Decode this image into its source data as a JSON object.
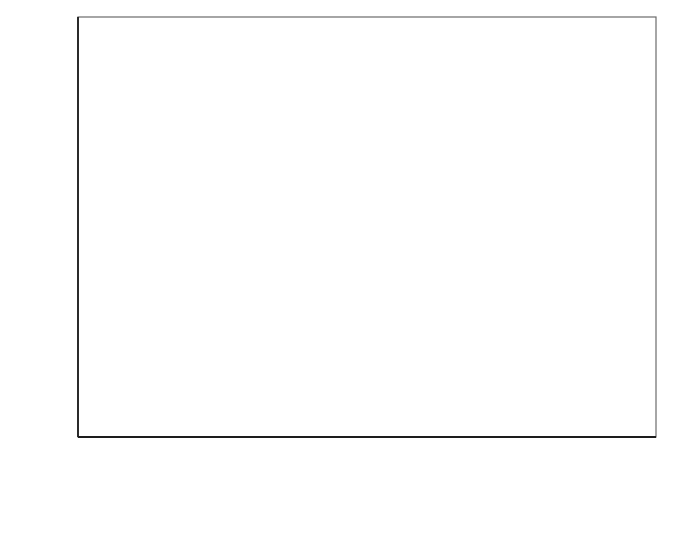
{
  "figure": {
    "background": "#ffffff",
    "frame_color": "#5a5a5a",
    "axis_color": "#1d1d1d"
  },
  "axes": {
    "y_label": "activity",
    "x_label_main": "x",
    "x_label_sub": "MgCl",
    "x_label_sub2": "2",
    "x_ticklabels": [
      "0,0",
      "0,2",
      "0,4",
      "0,6",
      "0,8",
      "1,0"
    ],
    "y_ticklabels": [
      "0,0",
      "0,2",
      "0,4",
      "0,6",
      "0,8",
      "1,0"
    ]
  },
  "chart_data": {
    "type": "scatter",
    "title": "",
    "xlabel": "x_MgCl2",
    "ylabel": "activity",
    "xlim": [
      0.0,
      1.0
    ],
    "ylim": [
      0.0,
      1.0
    ],
    "xticks": [
      0.0,
      0.2,
      0.4,
      0.6,
      0.8,
      1.0
    ],
    "yticks": [
      0.0,
      0.2,
      0.4,
      0.6,
      0.8,
      1.0
    ],
    "minor_tick_step": 0.1,
    "grid": false,
    "legend": "none",
    "decimal_separator": ",",
    "series": [
      {
        "name": "water activity",
        "marker": "open-triangle",
        "marker_color": "#ffffff",
        "marker_edge": "#606060",
        "line_style": "solid",
        "line_color": "#404040",
        "points": [
          {
            "x": 0.1,
            "y": 0.865
          },
          {
            "x": 0.15,
            "y": 0.77
          },
          {
            "x": 0.2,
            "y": 0.65
          },
          {
            "x": 0.25,
            "y": 0.525
          },
          {
            "x": 0.3,
            "y": 0.385
          },
          {
            "x": 0.35,
            "y": 0.265
          },
          {
            "x": 0.4,
            "y": 0.165
          },
          {
            "x": 0.45,
            "y": 0.1
          },
          {
            "x": 0.5,
            "y": 0.072
          },
          {
            "x": 0.6,
            "y": 0.03
          },
          {
            "x": 0.7,
            "y": 0.013
          },
          {
            "x": 0.8,
            "y": 0.006
          }
        ],
        "curve": [
          {
            "x": 0.0,
            "y": 1.0
          },
          {
            "x": 0.05,
            "y": 0.96
          },
          {
            "x": 0.1,
            "y": 0.89
          },
          {
            "x": 0.15,
            "y": 0.79
          },
          {
            "x": 0.2,
            "y": 0.665
          },
          {
            "x": 0.25,
            "y": 0.53
          },
          {
            "x": 0.3,
            "y": 0.395
          },
          {
            "x": 0.35,
            "y": 0.275
          },
          {
            "x": 0.4,
            "y": 0.18
          },
          {
            "x": 0.45,
            "y": 0.115
          },
          {
            "x": 0.5,
            "y": 0.073
          },
          {
            "x": 0.55,
            "y": 0.048
          },
          {
            "x": 0.6,
            "y": 0.032
          },
          {
            "x": 0.65,
            "y": 0.021
          },
          {
            "x": 0.7,
            "y": 0.014
          },
          {
            "x": 0.75,
            "y": 0.009
          },
          {
            "x": 0.8,
            "y": 0.005
          },
          {
            "x": 0.9,
            "y": 0.002
          },
          {
            "x": 1.0,
            "y": 0.0
          }
        ]
      },
      {
        "name": "MgCl2 activity",
        "marker": "filled-square",
        "marker_color": "#111111",
        "marker_edge": "#111111",
        "line_style": "dashed",
        "line_color": "#555555",
        "points": [
          {
            "x": 0.05,
            "y": 0.004
          },
          {
            "x": 0.1,
            "y": 0.004
          },
          {
            "x": 0.15,
            "y": 0.004
          },
          {
            "x": 0.2,
            "y": 0.003
          },
          {
            "x": 0.25,
            "y": 0.008
          },
          {
            "x": 0.3,
            "y": 0.013
          },
          {
            "x": 0.35,
            "y": 0.035
          },
          {
            "x": 0.4,
            "y": 0.038
          },
          {
            "x": 0.45,
            "y": 0.05
          },
          {
            "x": 0.5,
            "y": 0.075
          },
          {
            "x": 0.55,
            "y": 0.142
          },
          {
            "x": 0.6,
            "y": 0.215
          },
          {
            "x": 0.65,
            "y": 0.32
          },
          {
            "x": 0.7,
            "y": 0.437
          },
          {
            "x": 0.75,
            "y": 0.543
          },
          {
            "x": 0.8,
            "y": 0.636
          },
          {
            "x": 0.85,
            "y": 0.722
          }
        ],
        "curve": [
          {
            "x": 0.0,
            "y": 0.0
          },
          {
            "x": 0.1,
            "y": 0.002
          },
          {
            "x": 0.2,
            "y": 0.005
          },
          {
            "x": 0.25,
            "y": 0.01
          },
          {
            "x": 0.3,
            "y": 0.018
          },
          {
            "x": 0.35,
            "y": 0.03
          },
          {
            "x": 0.4,
            "y": 0.045
          },
          {
            "x": 0.45,
            "y": 0.062
          },
          {
            "x": 0.5,
            "y": 0.085
          },
          {
            "x": 0.55,
            "y": 0.125
          },
          {
            "x": 0.6,
            "y": 0.19
          },
          {
            "x": 0.65,
            "y": 0.285
          },
          {
            "x": 0.7,
            "y": 0.4
          },
          {
            "x": 0.75,
            "y": 0.52
          },
          {
            "x": 0.8,
            "y": 0.64
          },
          {
            "x": 0.85,
            "y": 0.745
          },
          {
            "x": 0.9,
            "y": 0.845
          },
          {
            "x": 0.95,
            "y": 0.93
          },
          {
            "x": 1.0,
            "y": 1.0
          }
        ]
      }
    ]
  }
}
